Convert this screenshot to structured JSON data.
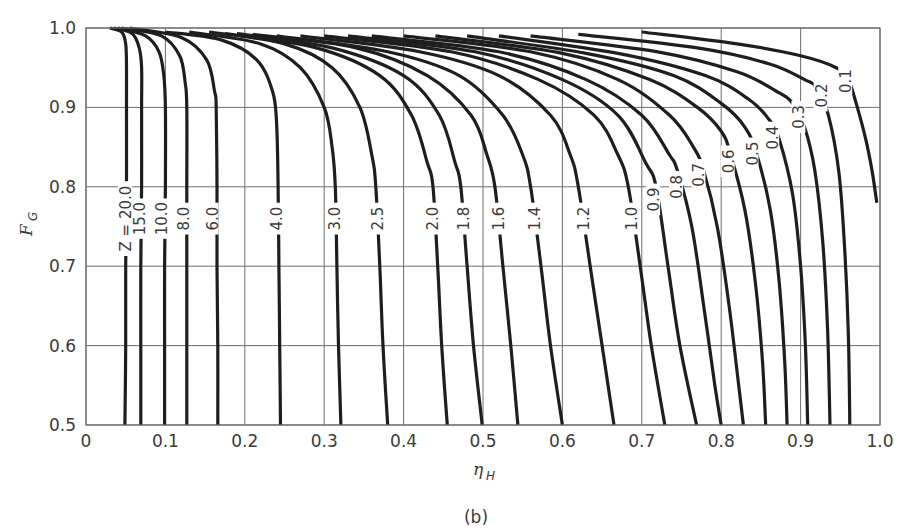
{
  "figure": {
    "caption": "(b)"
  },
  "chart_data": {
    "type": "line",
    "title": "",
    "xlabel": "ηH",
    "xlabel_main": "η",
    "xlabel_sub": "H",
    "ylabel": "FG",
    "ylabel_main": "F",
    "ylabel_sub": "G",
    "xlim": [
      0,
      1.0
    ],
    "ylim": [
      0.5,
      1.0
    ],
    "grid": true,
    "legend": "none (curves labeled inline)",
    "x_ticks": [
      "0",
      "0.1",
      "0.2",
      "0.3",
      "0.4",
      "0.5",
      "0.6",
      "0.7",
      "0.8",
      "0.9",
      "1.0"
    ],
    "y_ticks": [
      "0.5",
      "0.6",
      "0.7",
      "0.8",
      "0.9",
      "1.0"
    ],
    "parameter_name": "Z",
    "series": [
      {
        "name": "Z = 20.0",
        "label": "Z = 20.0",
        "label_at": [
          0.053,
          0.76
        ],
        "points": [
          [
            0.03,
            1.0
          ],
          [
            0.045,
            0.995
          ],
          [
            0.05,
            0.98
          ],
          [
            0.051,
            0.95
          ],
          [
            0.051,
            0.9
          ],
          [
            0.051,
            0.8
          ],
          [
            0.05,
            0.7
          ],
          [
            0.05,
            0.6
          ],
          [
            0.049,
            0.5
          ]
        ]
      },
      {
        "name": "Z = 15.0",
        "label": "15.0",
        "label_at": [
          0.071,
          0.76
        ],
        "points": [
          [
            0.035,
            1.0
          ],
          [
            0.058,
            0.993
          ],
          [
            0.067,
            0.975
          ],
          [
            0.07,
            0.95
          ],
          [
            0.07,
            0.9
          ],
          [
            0.07,
            0.8
          ],
          [
            0.069,
            0.7
          ],
          [
            0.069,
            0.6
          ],
          [
            0.069,
            0.5
          ]
        ]
      },
      {
        "name": "Z = 10.0",
        "label": "10.0",
        "label_at": [
          0.098,
          0.76
        ],
        "points": [
          [
            0.04,
            1.0
          ],
          [
            0.075,
            0.99
          ],
          [
            0.092,
            0.97
          ],
          [
            0.098,
            0.94
          ],
          [
            0.1,
            0.9
          ],
          [
            0.1,
            0.8
          ],
          [
            0.099,
            0.7
          ],
          [
            0.099,
            0.6
          ],
          [
            0.099,
            0.5
          ]
        ]
      },
      {
        "name": "Z = 8.0",
        "label": "8.0",
        "label_at": [
          0.126,
          0.76
        ],
        "points": [
          [
            0.045,
            1.0
          ],
          [
            0.095,
            0.99
          ],
          [
            0.118,
            0.965
          ],
          [
            0.125,
            0.93
          ],
          [
            0.127,
            0.9
          ],
          [
            0.127,
            0.8
          ],
          [
            0.127,
            0.7
          ],
          [
            0.127,
            0.6
          ],
          [
            0.127,
            0.5
          ]
        ]
      },
      {
        "name": "Z = 6.0",
        "label": "6.0",
        "label_at": [
          0.162,
          0.76
        ],
        "points": [
          [
            0.055,
            1.0
          ],
          [
            0.12,
            0.988
          ],
          [
            0.152,
            0.96
          ],
          [
            0.162,
            0.92
          ],
          [
            0.164,
            0.9
          ],
          [
            0.165,
            0.8
          ],
          [
            0.165,
            0.7
          ],
          [
            0.166,
            0.6
          ],
          [
            0.166,
            0.5
          ]
        ]
      },
      {
        "name": "Z = 4.0",
        "label": "4.0",
        "label_at": [
          0.243,
          0.76
        ],
        "points": [
          [
            0.1,
            0.995
          ],
          [
            0.17,
            0.985
          ],
          [
            0.215,
            0.96
          ],
          [
            0.235,
            0.92
          ],
          [
            0.24,
            0.88
          ],
          [
            0.242,
            0.8
          ],
          [
            0.243,
            0.7
          ],
          [
            0.244,
            0.6
          ],
          [
            0.245,
            0.5
          ]
        ]
      },
      {
        "name": "Z = 3.0",
        "label": "3.0",
        "label_at": [
          0.316,
          0.76
        ],
        "points": [
          [
            0.13,
            0.995
          ],
          [
            0.22,
            0.98
          ],
          [
            0.27,
            0.95
          ],
          [
            0.3,
            0.9
          ],
          [
            0.31,
            0.85
          ],
          [
            0.314,
            0.8
          ],
          [
            0.316,
            0.7
          ],
          [
            0.318,
            0.6
          ],
          [
            0.321,
            0.5
          ]
        ]
      },
      {
        "name": "Z = 2.5",
        "label": "2.5",
        "label_at": [
          0.37,
          0.76
        ],
        "points": [
          [
            0.155,
            0.995
          ],
          [
            0.25,
            0.98
          ],
          [
            0.31,
            0.95
          ],
          [
            0.345,
            0.9
          ],
          [
            0.36,
            0.84
          ],
          [
            0.365,
            0.8
          ],
          [
            0.37,
            0.7
          ],
          [
            0.374,
            0.6
          ],
          [
            0.38,
            0.5
          ]
        ]
      },
      {
        "name": "Z = 2.0",
        "label": "2.0",
        "label_at": [
          0.44,
          0.76
        ],
        "points": [
          [
            0.175,
            0.993
          ],
          [
            0.29,
            0.975
          ],
          [
            0.37,
            0.94
          ],
          [
            0.41,
            0.89
          ],
          [
            0.43,
            0.83
          ],
          [
            0.437,
            0.8
          ],
          [
            0.443,
            0.7
          ],
          [
            0.448,
            0.6
          ],
          [
            0.455,
            0.5
          ]
        ]
      },
      {
        "name": "Z = 1.8",
        "label": "1.8",
        "label_at": [
          0.478,
          0.76
        ],
        "points": [
          [
            0.19,
            0.993
          ],
          [
            0.31,
            0.975
          ],
          [
            0.4,
            0.94
          ],
          [
            0.445,
            0.89
          ],
          [
            0.465,
            0.83
          ],
          [
            0.472,
            0.8
          ],
          [
            0.48,
            0.7
          ],
          [
            0.488,
            0.6
          ],
          [
            0.499,
            0.5
          ]
        ]
      },
      {
        "name": "Z = 1.6",
        "label": "1.6",
        "label_at": [
          0.522,
          0.76
        ],
        "points": [
          [
            0.21,
            0.992
          ],
          [
            0.34,
            0.975
          ],
          [
            0.43,
            0.94
          ],
          [
            0.485,
            0.89
          ],
          [
            0.505,
            0.84
          ],
          [
            0.515,
            0.8
          ],
          [
            0.525,
            0.7
          ],
          [
            0.535,
            0.6
          ],
          [
            0.544,
            0.5
          ]
        ]
      },
      {
        "name": "Z = 1.4",
        "label": "1.4",
        "label_at": [
          0.568,
          0.76
        ],
        "points": [
          [
            0.24,
            0.99
          ],
          [
            0.38,
            0.97
          ],
          [
            0.47,
            0.94
          ],
          [
            0.525,
            0.89
          ],
          [
            0.55,
            0.84
          ],
          [
            0.56,
            0.8
          ],
          [
            0.573,
            0.7
          ],
          [
            0.585,
            0.6
          ],
          [
            0.6,
            0.5
          ]
        ]
      },
      {
        "name": "Z = 1.2",
        "label": "1.2",
        "label_at": [
          0.63,
          0.76
        ],
        "points": [
          [
            0.27,
            0.99
          ],
          [
            0.42,
            0.97
          ],
          [
            0.52,
            0.94
          ],
          [
            0.585,
            0.89
          ],
          [
            0.61,
            0.84
          ],
          [
            0.62,
            0.8
          ],
          [
            0.635,
            0.7
          ],
          [
            0.65,
            0.6
          ],
          [
            0.665,
            0.5
          ]
        ]
      },
      {
        "name": "Z = 1.0",
        "label": "1.0",
        "label_at": [
          0.69,
          0.76
        ],
        "points": [
          [
            0.3,
            0.99
          ],
          [
            0.46,
            0.97
          ],
          [
            0.57,
            0.935
          ],
          [
            0.64,
            0.89
          ],
          [
            0.67,
            0.84
          ],
          [
            0.683,
            0.8
          ],
          [
            0.698,
            0.7
          ],
          [
            0.712,
            0.6
          ],
          [
            0.729,
            0.5
          ]
        ]
      },
      {
        "name": "Z = 0.9",
        "label": "0.9",
        "label_at": [
          0.718,
          0.784
        ],
        "points": [
          [
            0.33,
            0.99
          ],
          [
            0.49,
            0.97
          ],
          [
            0.6,
            0.935
          ],
          [
            0.67,
            0.89
          ],
          [
            0.705,
            0.83
          ],
          [
            0.718,
            0.8
          ],
          [
            0.733,
            0.7
          ],
          [
            0.748,
            0.6
          ],
          [
            0.769,
            0.5
          ]
        ]
      },
      {
        "name": "Z = 0.8",
        "label": "0.8",
        "label_at": [
          0.747,
          0.8
        ],
        "points": [
          [
            0.36,
            0.99
          ],
          [
            0.52,
            0.97
          ],
          [
            0.63,
            0.935
          ],
          [
            0.7,
            0.89
          ],
          [
            0.735,
            0.84
          ],
          [
            0.745,
            0.82
          ],
          [
            0.763,
            0.75
          ],
          [
            0.778,
            0.65
          ],
          [
            0.792,
            0.55
          ],
          [
            0.8,
            0.5
          ]
        ]
      },
      {
        "name": "Z = 0.7",
        "label": "0.7",
        "label_at": [
          0.775,
          0.815
        ],
        "points": [
          [
            0.4,
            0.99
          ],
          [
            0.56,
            0.97
          ],
          [
            0.67,
            0.935
          ],
          [
            0.735,
            0.89
          ],
          [
            0.765,
            0.85
          ],
          [
            0.778,
            0.82
          ],
          [
            0.795,
            0.75
          ],
          [
            0.81,
            0.65
          ],
          [
            0.822,
            0.55
          ],
          [
            0.828,
            0.5
          ]
        ]
      },
      {
        "name": "Z = 0.6",
        "label": "0.6",
        "label_at": [
          0.812,
          0.832
        ],
        "points": [
          [
            0.44,
            0.99
          ],
          [
            0.6,
            0.968
          ],
          [
            0.71,
            0.935
          ],
          [
            0.77,
            0.9
          ],
          [
            0.8,
            0.87
          ],
          [
            0.812,
            0.84
          ],
          [
            0.83,
            0.77
          ],
          [
            0.843,
            0.68
          ],
          [
            0.852,
            0.58
          ],
          [
            0.856,
            0.5
          ]
        ]
      },
      {
        "name": "Z = 0.5",
        "label": "0.5",
        "label_at": [
          0.842,
          0.842
        ],
        "points": [
          [
            0.48,
            0.99
          ],
          [
            0.63,
            0.968
          ],
          [
            0.74,
            0.94
          ],
          [
            0.8,
            0.905
          ],
          [
            0.83,
            0.875
          ],
          [
            0.845,
            0.84
          ],
          [
            0.862,
            0.77
          ],
          [
            0.873,
            0.68
          ],
          [
            0.88,
            0.58
          ],
          [
            0.883,
            0.5
          ]
        ]
      },
      {
        "name": "Z = 0.4",
        "label": "0.4",
        "label_at": [
          0.868,
          0.862
        ],
        "points": [
          [
            0.52,
            0.99
          ],
          [
            0.67,
            0.968
          ],
          [
            0.78,
            0.94
          ],
          [
            0.835,
            0.91
          ],
          [
            0.86,
            0.885
          ],
          [
            0.873,
            0.86
          ],
          [
            0.89,
            0.79
          ],
          [
            0.9,
            0.7
          ],
          [
            0.906,
            0.6
          ],
          [
            0.909,
            0.5
          ]
        ]
      },
      {
        "name": "Z = 0.3",
        "label": "0.3",
        "label_at": [
          0.901,
          0.888
        ],
        "points": [
          [
            0.56,
            0.99
          ],
          [
            0.72,
            0.97
          ],
          [
            0.82,
            0.945
          ],
          [
            0.87,
            0.92
          ],
          [
            0.89,
            0.905
          ],
          [
            0.905,
            0.875
          ],
          [
            0.918,
            0.82
          ],
          [
            0.928,
            0.73
          ],
          [
            0.934,
            0.62
          ],
          [
            0.937,
            0.5
          ]
        ]
      },
      {
        "name": "Z = 0.2",
        "label": "0.2",
        "label_at": [
          0.929,
          0.915
        ],
        "points": [
          [
            0.62,
            0.992
          ],
          [
            0.77,
            0.975
          ],
          [
            0.86,
            0.955
          ],
          [
            0.905,
            0.935
          ],
          [
            0.92,
            0.925
          ],
          [
            0.935,
            0.89
          ],
          [
            0.948,
            0.82
          ],
          [
            0.955,
            0.73
          ],
          [
            0.96,
            0.62
          ],
          [
            0.962,
            0.5
          ]
        ]
      },
      {
        "name": "Z = 0.1",
        "label": "0.1",
        "label_at": [
          0.96,
          0.933
        ],
        "points": [
          [
            0.7,
            0.995
          ],
          [
            0.82,
            0.98
          ],
          [
            0.9,
            0.965
          ],
          [
            0.945,
            0.95
          ],
          [
            0.96,
            0.935
          ],
          [
            0.97,
            0.905
          ],
          [
            0.982,
            0.86
          ],
          [
            0.99,
            0.82
          ],
          [
            0.996,
            0.78
          ]
        ]
      }
    ]
  }
}
